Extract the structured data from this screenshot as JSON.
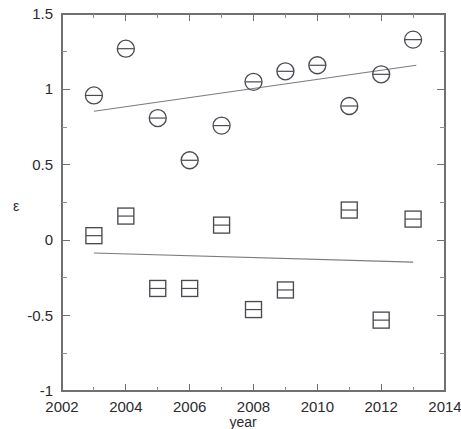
{
  "chart_data": {
    "type": "scatter",
    "title": "",
    "xlabel": "year",
    "ylabel": "ε",
    "xlim": [
      2002,
      2014
    ],
    "ylim": [
      -1,
      1.5
    ],
    "xticks": [
      2002,
      2004,
      2006,
      2008,
      2010,
      2012,
      2014
    ],
    "xtick_labels": [
      "2002",
      "2004",
      "2006",
      "2008",
      "2010",
      "2012",
      "2014"
    ],
    "xminor_ticks": [
      2003,
      2005,
      2007,
      2009,
      2011,
      2013
    ],
    "yticks": [
      -1,
      -0.5,
      0,
      0.5,
      1,
      1.5
    ],
    "ytick_labels": [
      "-1",
      "-0.5",
      "0",
      "0.5",
      "1",
      "1.5"
    ],
    "yminor_ticks": [
      -0.75,
      -0.25,
      0.25,
      0.75,
      1.25
    ],
    "grid": false,
    "legend": "none",
    "series": [
      {
        "name": "circle-series",
        "marker": "circle-with-horizontal-bar",
        "x": [
          2003,
          2004,
          2005,
          2006,
          2007,
          2008,
          2009,
          2010,
          2011,
          2012,
          2013
        ],
        "values": [
          0.96,
          1.27,
          0.81,
          0.53,
          0.76,
          1.05,
          1.12,
          1.16,
          0.89,
          1.1,
          1.33
        ],
        "trend": {
          "x0": 2003,
          "y0": 0.855,
          "x1": 2013.1,
          "y1": 1.16
        }
      },
      {
        "name": "square-series",
        "marker": "square-with-horizontal-bar",
        "x": [
          2003,
          2004,
          2005,
          2006,
          2007,
          2008,
          2009,
          2011,
          2012,
          2013
        ],
        "values": [
          0.03,
          0.16,
          -0.32,
          -0.32,
          0.1,
          -0.46,
          -0.33,
          0.2,
          -0.53,
          0.14
        ],
        "trend": {
          "x0": 2003,
          "y0": -0.085,
          "x1": 2013.0,
          "y1": -0.145
        }
      }
    ]
  }
}
